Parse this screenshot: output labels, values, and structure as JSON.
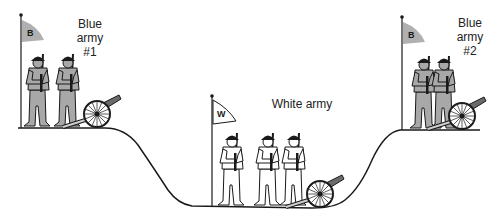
{
  "diagram": {
    "armies": [
      {
        "id": "blue1",
        "label_lines": [
          "Blue",
          "army",
          "#1"
        ],
        "flag_letter": "B",
        "color": "#a8a8a8",
        "soldiers": 2,
        "position": "left hill"
      },
      {
        "id": "white",
        "label_lines": [
          "White army"
        ],
        "flag_letter": "W",
        "color": "#ffffff",
        "soldiers": 3,
        "position": "valley"
      },
      {
        "id": "blue2",
        "label_lines": [
          "Blue",
          "army",
          "#2"
        ],
        "flag_letter": "B",
        "color": "#a8a8a8",
        "soldiers": 2,
        "position": "right hill"
      }
    ],
    "colors": {
      "line": "#1a1a1a",
      "blue_fill": "#a8a8a8",
      "white_fill": "#ffffff",
      "flag_blue": "#b0b0b0"
    }
  }
}
